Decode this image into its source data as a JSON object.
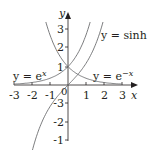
{
  "chart_data": {
    "type": "line",
    "title": "",
    "xlabel": "x",
    "ylabel": "y",
    "xlim": [
      -3,
      3
    ],
    "ylim": [
      -3,
      3
    ],
    "x_ticks": [
      "-3",
      "-2",
      "-1",
      "0",
      "1",
      "2",
      "3"
    ],
    "y_ticks": [
      "-3",
      "-2",
      "-1",
      "1",
      "2",
      "3"
    ],
    "origin_label": "0",
    "grid": false,
    "series": [
      {
        "name": "y = e^x",
        "label_main": "y = e",
        "label_sup": "x",
        "function": "exp(x)"
      },
      {
        "name": "y = e^-x",
        "label_main": "y = e",
        "label_sup": "−x",
        "function": "exp(-x)"
      },
      {
        "name": "y = sinh x",
        "label_main": "y = sinh",
        "label_sup": "",
        "label_var": "x",
        "function": "sinh(x)"
      }
    ]
  },
  "colors": {
    "axis": "#231f20",
    "curve": "#6d6e71"
  }
}
